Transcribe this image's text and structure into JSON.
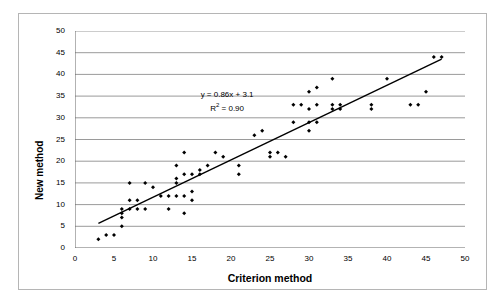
{
  "chart_data": {
    "type": "scatter",
    "title": "",
    "xlabel": "Criterion method",
    "ylabel": "New method",
    "xlim": [
      0,
      50
    ],
    "ylim": [
      0,
      50
    ],
    "xticks": [
      0,
      5,
      10,
      15,
      20,
      25,
      30,
      35,
      40,
      45,
      50
    ],
    "yticks": [
      0,
      5,
      10,
      15,
      20,
      25,
      30,
      35,
      40,
      45,
      50
    ],
    "grid": "horizontal",
    "legend": "none",
    "marker": "diamond",
    "marker_color": "#000000",
    "annotation_line1": "y = 0.86x + 3.1",
    "annotation_line2_prefix": "R",
    "annotation_line2_sup": "2",
    "annotation_line2_suffix": " = 0.90",
    "trendline": {
      "type": "line",
      "slope": 0.86,
      "intercept": 3.1,
      "x_start": 3,
      "x_end": 47,
      "color": "#000000",
      "width": 1.4
    },
    "points": [
      {
        "x": 3,
        "y": 2
      },
      {
        "x": 4,
        "y": 3
      },
      {
        "x": 5,
        "y": 3
      },
      {
        "x": 6,
        "y": 5
      },
      {
        "x": 6,
        "y": 7
      },
      {
        "x": 6,
        "y": 8
      },
      {
        "x": 6,
        "y": 9
      },
      {
        "x": 7,
        "y": 9
      },
      {
        "x": 7,
        "y": 11
      },
      {
        "x": 7,
        "y": 15
      },
      {
        "x": 8,
        "y": 9
      },
      {
        "x": 8,
        "y": 11
      },
      {
        "x": 9,
        "y": 9
      },
      {
        "x": 9,
        "y": 15
      },
      {
        "x": 10,
        "y": 14
      },
      {
        "x": 11,
        "y": 12
      },
      {
        "x": 12,
        "y": 9
      },
      {
        "x": 12,
        "y": 12
      },
      {
        "x": 13,
        "y": 12
      },
      {
        "x": 13,
        "y": 15
      },
      {
        "x": 13,
        "y": 16
      },
      {
        "x": 13,
        "y": 19
      },
      {
        "x": 14,
        "y": 8
      },
      {
        "x": 14,
        "y": 12
      },
      {
        "x": 14,
        "y": 17
      },
      {
        "x": 14,
        "y": 22
      },
      {
        "x": 15,
        "y": 11
      },
      {
        "x": 15,
        "y": 13
      },
      {
        "x": 15,
        "y": 17
      },
      {
        "x": 16,
        "y": 17
      },
      {
        "x": 16,
        "y": 18
      },
      {
        "x": 17,
        "y": 19
      },
      {
        "x": 18,
        "y": 22
      },
      {
        "x": 19,
        "y": 21
      },
      {
        "x": 21,
        "y": 17
      },
      {
        "x": 21,
        "y": 19
      },
      {
        "x": 23,
        "y": 26
      },
      {
        "x": 24,
        "y": 27
      },
      {
        "x": 25,
        "y": 21
      },
      {
        "x": 25,
        "y": 22
      },
      {
        "x": 26,
        "y": 22
      },
      {
        "x": 27,
        "y": 21
      },
      {
        "x": 28,
        "y": 29
      },
      {
        "x": 28,
        "y": 33
      },
      {
        "x": 29,
        "y": 33
      },
      {
        "x": 30,
        "y": 27
      },
      {
        "x": 30,
        "y": 29
      },
      {
        "x": 30,
        "y": 32
      },
      {
        "x": 30,
        "y": 36
      },
      {
        "x": 31,
        "y": 29
      },
      {
        "x": 31,
        "y": 33
      },
      {
        "x": 31,
        "y": 37
      },
      {
        "x": 33,
        "y": 32
      },
      {
        "x": 33,
        "y": 33
      },
      {
        "x": 33,
        "y": 39
      },
      {
        "x": 34,
        "y": 32
      },
      {
        "x": 34,
        "y": 33
      },
      {
        "x": 38,
        "y": 32
      },
      {
        "x": 38,
        "y": 33
      },
      {
        "x": 40,
        "y": 39
      },
      {
        "x": 43,
        "y": 33
      },
      {
        "x": 44,
        "y": 33
      },
      {
        "x": 45,
        "y": 36
      },
      {
        "x": 46,
        "y": 44
      },
      {
        "x": 47,
        "y": 44
      }
    ]
  }
}
